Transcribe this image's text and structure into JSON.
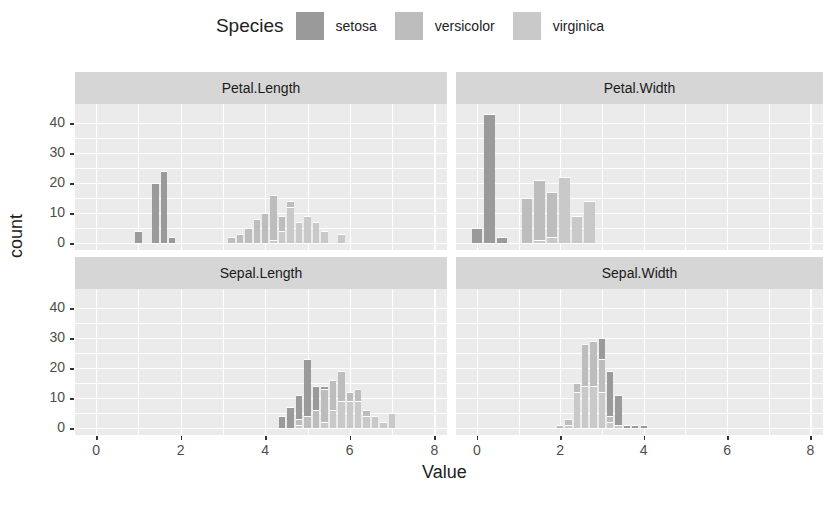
{
  "legend": {
    "title": "Species",
    "items": [
      {
        "label": "setosa",
        "color": "#9a9a9a"
      },
      {
        "label": "versicolor",
        "color": "#bdbdbd"
      },
      {
        "label": "virginica",
        "color": "#c9c9c9"
      }
    ]
  },
  "axes": {
    "xlabel": "Value",
    "ylabel": "count",
    "xticks": [
      "0",
      "2",
      "4",
      "6",
      "8"
    ],
    "yticks": [
      "0",
      "10",
      "20",
      "30",
      "40"
    ]
  },
  "chart_data": {
    "type": "bar",
    "subtype": "stacked histogram, faceted",
    "title": "",
    "xlabel": "Value",
    "ylabel": "count",
    "xlim": [
      -0.5,
      8.3
    ],
    "ylim": [
      0,
      44
    ],
    "legend_position": "top",
    "grid": true,
    "series_names": [
      "setosa",
      "versicolor",
      "virginica"
    ],
    "facets": [
      {
        "name": "Petal.Length",
        "bins": [
          {
            "x": 1.0,
            "setosa": 4,
            "versicolor": 0,
            "virginica": 0
          },
          {
            "x": 1.4,
            "setosa": 20,
            "versicolor": 0,
            "virginica": 0
          },
          {
            "x": 1.6,
            "setosa": 24,
            "versicolor": 0,
            "virginica": 0
          },
          {
            "x": 1.8,
            "setosa": 2,
            "versicolor": 0,
            "virginica": 0
          },
          {
            "x": 3.2,
            "setosa": 0,
            "versicolor": 2,
            "virginica": 0
          },
          {
            "x": 3.4,
            "setosa": 0,
            "versicolor": 3,
            "virginica": 0
          },
          {
            "x": 3.6,
            "setosa": 0,
            "versicolor": 5,
            "virginica": 0
          },
          {
            "x": 3.8,
            "setosa": 0,
            "versicolor": 8,
            "virginica": 0
          },
          {
            "x": 4.0,
            "setosa": 0,
            "versicolor": 10,
            "virginica": 0
          },
          {
            "x": 4.2,
            "setosa": 0,
            "versicolor": 15,
            "virginica": 1
          },
          {
            "x": 4.4,
            "setosa": 0,
            "versicolor": 5,
            "virginica": 4
          },
          {
            "x": 4.6,
            "setosa": 0,
            "versicolor": 2,
            "virginica": 12
          },
          {
            "x": 4.8,
            "setosa": 0,
            "versicolor": 0,
            "virginica": 7
          },
          {
            "x": 5.0,
            "setosa": 0,
            "versicolor": 0,
            "virginica": 9
          },
          {
            "x": 5.2,
            "setosa": 0,
            "versicolor": 0,
            "virginica": 7
          },
          {
            "x": 5.4,
            "setosa": 0,
            "versicolor": 0,
            "virginica": 4
          },
          {
            "x": 5.6,
            "setosa": 0,
            "versicolor": 0,
            "virginica": 0
          },
          {
            "x": 5.8,
            "setosa": 0,
            "versicolor": 0,
            "virginica": 3
          },
          {
            "x": 6.0,
            "setosa": 0,
            "versicolor": 0,
            "virginica": 0
          }
        ]
      },
      {
        "name": "Petal.Width",
        "bins": [
          {
            "x": 0.0,
            "setosa": 5,
            "versicolor": 0,
            "virginica": 0
          },
          {
            "x": 0.3,
            "setosa": 43,
            "versicolor": 0,
            "virginica": 0
          },
          {
            "x": 0.6,
            "setosa": 2,
            "versicolor": 0,
            "virginica": 0
          },
          {
            "x": 1.2,
            "setosa": 0,
            "versicolor": 15,
            "virginica": 0
          },
          {
            "x": 1.5,
            "setosa": 0,
            "versicolor": 20,
            "virginica": 1
          },
          {
            "x": 1.8,
            "setosa": 0,
            "versicolor": 15,
            "virginica": 2
          },
          {
            "x": 2.1,
            "setosa": 0,
            "versicolor": 0,
            "virginica": 22
          },
          {
            "x": 2.4,
            "setosa": 0,
            "versicolor": 0,
            "virginica": 9
          },
          {
            "x": 2.7,
            "setosa": 0,
            "versicolor": 0,
            "virginica": 14
          }
        ]
      },
      {
        "name": "Sepal.Length",
        "bins": [
          {
            "x": 4.4,
            "setosa": 4,
            "versicolor": 0,
            "virginica": 0
          },
          {
            "x": 4.6,
            "setosa": 7,
            "versicolor": 0,
            "virginica": 0
          },
          {
            "x": 4.8,
            "setosa": 8,
            "versicolor": 2,
            "virginica": 1
          },
          {
            "x": 5.0,
            "setosa": 19,
            "versicolor": 4,
            "virginica": 0
          },
          {
            "x": 5.2,
            "setosa": 8,
            "versicolor": 6,
            "virginica": 0
          },
          {
            "x": 5.4,
            "setosa": 1,
            "versicolor": 11,
            "virginica": 2
          },
          {
            "x": 5.6,
            "setosa": 0,
            "versicolor": 10,
            "virginica": 6
          },
          {
            "x": 5.8,
            "setosa": 0,
            "versicolor": 10,
            "virginica": 9
          },
          {
            "x": 6.0,
            "setosa": 0,
            "versicolor": 3,
            "virginica": 9
          },
          {
            "x": 6.2,
            "setosa": 0,
            "versicolor": 4,
            "virginica": 9
          },
          {
            "x": 6.4,
            "setosa": 0,
            "versicolor": 2,
            "virginica": 4
          },
          {
            "x": 6.6,
            "setosa": 0,
            "versicolor": 0,
            "virginica": 4
          },
          {
            "x": 6.8,
            "setosa": 0,
            "versicolor": 0,
            "virginica": 2
          },
          {
            "x": 7.0,
            "setosa": 0,
            "versicolor": 0,
            "virginica": 5
          }
        ]
      },
      {
        "name": "Sepal.Width",
        "bins": [
          {
            "x": 2.0,
            "setosa": 0,
            "versicolor": 1,
            "virginica": 0
          },
          {
            "x": 2.2,
            "setosa": 0,
            "versicolor": 2,
            "virginica": 1
          },
          {
            "x": 2.4,
            "setosa": 0,
            "versicolor": 3,
            "virginica": 12
          },
          {
            "x": 2.6,
            "setosa": 0,
            "versicolor": 14,
            "virginica": 14
          },
          {
            "x": 2.8,
            "setosa": 0,
            "versicolor": 15,
            "virginica": 14
          },
          {
            "x": 3.0,
            "setosa": 7,
            "versicolor": 11,
            "virginica": 12
          },
          {
            "x": 3.2,
            "setosa": 15,
            "versicolor": 2,
            "virginica": 2
          },
          {
            "x": 3.4,
            "setosa": 10,
            "versicolor": 0,
            "virginica": 1
          },
          {
            "x": 3.6,
            "setosa": 1,
            "versicolor": 0,
            "virginica": 0
          },
          {
            "x": 3.8,
            "setosa": 1,
            "versicolor": 0,
            "virginica": 0
          },
          {
            "x": 4.0,
            "setosa": 1,
            "versicolor": 0,
            "virginica": 0
          }
        ]
      }
    ]
  }
}
